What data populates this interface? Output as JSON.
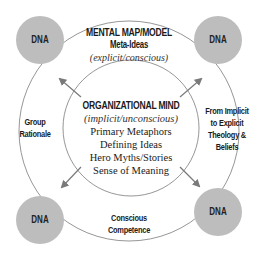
{
  "diagram": {
    "colors": {
      "dna_fill": "#bdbdbd",
      "line": "#8a8a8a",
      "arrow": "#7a7a7a",
      "text": "#1a1a1a"
    },
    "outer_circle": {
      "title": "MENTAL MAP/MODEL",
      "subtitle": "Meta-Ideas",
      "note": "(explicit/conscious)"
    },
    "inner_circle": {
      "title": "ORGANIZATIONAL MIND",
      "note": "(implicit/unconscious)",
      "items": [
        "Primary Metaphors",
        "Defining Ideas",
        "Hero Myths/Stories",
        "Sense of Meaning"
      ]
    },
    "side_labels": {
      "left": [
        "Group",
        "Rationale"
      ],
      "right": [
        "From Implicit",
        "to Explicit",
        "Theology &",
        "Beliefs"
      ],
      "bottom": [
        "Conscious",
        "Competence"
      ]
    },
    "dna_nodes": [
      {
        "label": "DNA",
        "position": "top-left"
      },
      {
        "label": "DNA",
        "position": "top-right"
      },
      {
        "label": "DNA",
        "position": "bottom-left"
      },
      {
        "label": "DNA",
        "position": "bottom-right"
      }
    ]
  }
}
